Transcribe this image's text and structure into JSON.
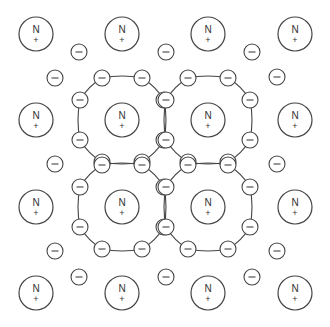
{
  "diagram": {
    "title": "",
    "ion_label": "N",
    "ion_charge": "+",
    "electron_label": "−",
    "stroke_color": "#444444",
    "background": "#ffffff",
    "ion_radius": 17,
    "electron_radius": 8,
    "ions": [
      {
        "x": 36,
        "y": 34
      },
      {
        "x": 122,
        "y": 34
      },
      {
        "x": 208,
        "y": 34
      },
      {
        "x": 295,
        "y": 34
      },
      {
        "x": 36,
        "y": 120
      },
      {
        "x": 122,
        "y": 120
      },
      {
        "x": 208,
        "y": 120
      },
      {
        "x": 295,
        "y": 120
      },
      {
        "x": 36,
        "y": 207
      },
      {
        "x": 122,
        "y": 207
      },
      {
        "x": 208,
        "y": 207
      },
      {
        "x": 295,
        "y": 207
      },
      {
        "x": 36,
        "y": 293
      },
      {
        "x": 122,
        "y": 293
      },
      {
        "x": 208,
        "y": 293
      },
      {
        "x": 295,
        "y": 293
      }
    ],
    "free_electrons": [
      {
        "x": 79,
        "y": 52
      },
      {
        "x": 166,
        "y": 52
      },
      {
        "x": 252,
        "y": 52
      },
      {
        "x": 79,
        "y": 277
      },
      {
        "x": 166,
        "y": 277
      },
      {
        "x": 252,
        "y": 277
      },
      {
        "x": 55,
        "y": 78
      },
      {
        "x": 55,
        "y": 164
      },
      {
        "x": 55,
        "y": 251
      },
      {
        "x": 277,
        "y": 77
      },
      {
        "x": 277,
        "y": 164
      },
      {
        "x": 277,
        "y": 251
      }
    ],
    "rings": [
      {
        "cx": 122,
        "cy": 120
      },
      {
        "cx": 208,
        "cy": 120
      },
      {
        "cx": 122,
        "cy": 207
      },
      {
        "cx": 208,
        "cy": 207
      }
    ],
    "ring_electron_offsets": [
      {
        "dx": -20,
        "dy": -42
      },
      {
        "dx": 20,
        "dy": -42
      },
      {
        "dx": 42,
        "dy": -20
      },
      {
        "dx": 42,
        "dy": 20
      },
      {
        "dx": 20,
        "dy": 42
      },
      {
        "dx": -20,
        "dy": 42
      },
      {
        "dx": -42,
        "dy": 20
      },
      {
        "dx": -42,
        "dy": -20
      }
    ]
  }
}
